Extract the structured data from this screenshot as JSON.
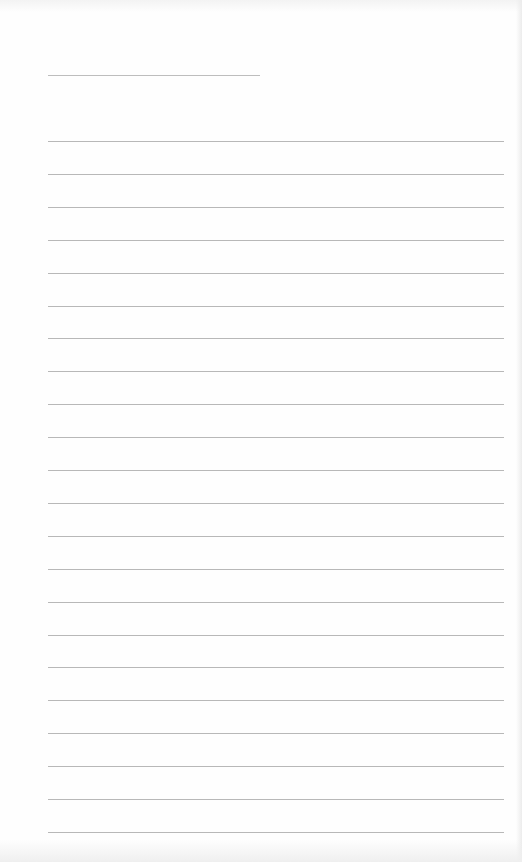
{
  "document": {
    "type": "blank lined paper",
    "title_line": {
      "x": 48,
      "y": 75,
      "width": 212
    },
    "ruled_lines": {
      "count": 22,
      "x": 48,
      "width": 456,
      "first_y": 141,
      "spacing": 32.9
    },
    "line_color": "#b8b8b8",
    "paper_color": "#fefefe",
    "text": []
  }
}
